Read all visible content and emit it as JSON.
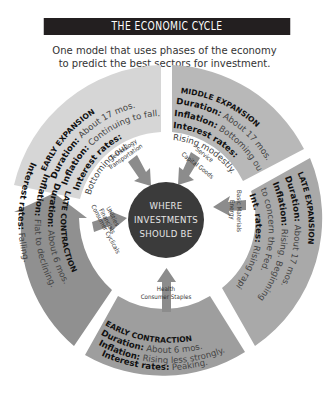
{
  "header": {
    "title": "THE ECONOMIC CYCLE",
    "subtitle_line1": "One model that uses phases of the economy",
    "subtitle_line2": "to predict the best sectors for investment."
  },
  "center": {
    "line1": "WHERE",
    "line2": "INVESTMENTS",
    "line3": "SHOULD BE"
  },
  "phases": [
    {
      "id": "early-expansion",
      "name": "EARLY EXPANSION",
      "duration_label": "Duration:",
      "duration": "About 17 mos.",
      "inflation_label": "Inflation:",
      "inflation": "Continuing to fall.",
      "rates_label": "Interest rates:",
      "rates": "Bottoming out.",
      "sectors": [
        "Technology",
        "Transportation"
      ],
      "color": "#d4d4d4"
    },
    {
      "id": "middle-expansion",
      "name": "MIDDLE EXPANSION",
      "duration_label": "Duration:",
      "duration": "About 17 mos.",
      "inflation_label": "Inflation:",
      "inflation": "Bottoming out.",
      "rates_label": "Interest rates:",
      "rates": "Rising modestly.",
      "sectors": [
        "Service",
        "Capital Goods"
      ],
      "color": "#b9b9b9"
    },
    {
      "id": "late-expansion",
      "name": "LATE EXPANSION",
      "duration_label": "Duration:",
      "duration": "About 17 mos.",
      "inflation_label": "Inflation:",
      "inflation": "Rising. Beginning",
      "inflation_cont": "to concern the Fed.",
      "rates_label": "Int. rates:",
      "rates": "Rising rapidly.",
      "sectors": [
        "Basic Materials",
        "Energy"
      ],
      "color": "#a8a8a8"
    },
    {
      "id": "early-contraction",
      "name": "EARLY CONTRACTION",
      "duration_label": "Duration:",
      "duration": "About 6 mos.",
      "inflation_label": "Inflation:",
      "inflation": "Rising less strongly.",
      "rates_label": "Interest rates:",
      "rates": "Peaking.",
      "sectors": [
        "Health",
        "Consumer Staples"
      ],
      "color": "#9d9d9d"
    },
    {
      "id": "late-contraction",
      "name": "LATE CONTRACTION",
      "duration_label": "Duration:",
      "duration": "About 6 mos.",
      "inflation_label": "Inflation:",
      "inflation": "Flat to declining.",
      "rates_label": "Interest rates:",
      "rates": "Falling.",
      "sectors": [
        "Utilities",
        "Financials",
        "Consumer Cyclicals"
      ],
      "color": "#8f8f8f"
    }
  ],
  "colors": {
    "title_bg": "#231f20",
    "center_circle": "#3a3a3a",
    "arrow": "#8c8c8c"
  }
}
